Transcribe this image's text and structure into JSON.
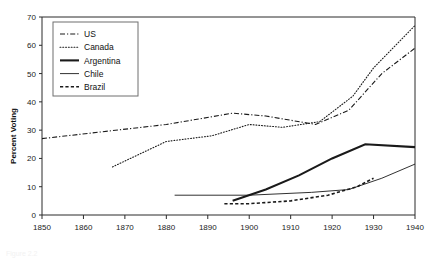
{
  "caption": "Figure 2.2",
  "chart_data": {
    "type": "line",
    "title": "",
    "xlabel": "",
    "ylabel": "Percent Voting",
    "xlim": [
      1850,
      1940
    ],
    "ylim": [
      0,
      70
    ],
    "xticks": [
      1850,
      1860,
      1870,
      1880,
      1890,
      1900,
      1910,
      1920,
      1930,
      1940
    ],
    "yticks": [
      0,
      10,
      20,
      30,
      40,
      50,
      60,
      70
    ],
    "grid": false,
    "legend_position": "top-left",
    "series": [
      {
        "name": "US",
        "style": "dash-dot",
        "width": 1.1,
        "x": [
          1850,
          1880,
          1896,
          1904,
          1916,
          1924,
          1932,
          1940
        ],
        "values": [
          27,
          32,
          36,
          35,
          32,
          37,
          50,
          59
        ]
      },
      {
        "name": "Canada",
        "style": "dotted",
        "width": 1.1,
        "x": [
          1867,
          1880,
          1891,
          1900,
          1908,
          1917,
          1925,
          1930,
          1940
        ],
        "values": [
          17,
          26,
          28,
          32,
          31,
          33,
          42,
          52,
          67
        ]
      },
      {
        "name": "Argentina",
        "style": "solid",
        "width": 2.1,
        "x": [
          1896,
          1904,
          1912,
          1920,
          1928,
          1940
        ],
        "values": [
          5,
          9,
          14,
          20,
          25,
          24
        ]
      },
      {
        "name": "Chile",
        "style": "solid",
        "width": 0.9,
        "x": [
          1882,
          1900,
          1915,
          1924,
          1932,
          1940
        ],
        "values": [
          7,
          7,
          8,
          9,
          13,
          18
        ]
      },
      {
        "name": "Brazil",
        "style": "dashed",
        "width": 1.6,
        "x": [
          1894,
          1900,
          1910,
          1919,
          1926,
          1930
        ],
        "values": [
          4,
          4,
          5,
          7,
          10,
          13
        ]
      }
    ]
  },
  "legend": {
    "items": [
      {
        "label": "US"
      },
      {
        "label": "Canada"
      },
      {
        "label": "Argentina"
      },
      {
        "label": "Chile"
      },
      {
        "label": "Brazil"
      }
    ]
  }
}
